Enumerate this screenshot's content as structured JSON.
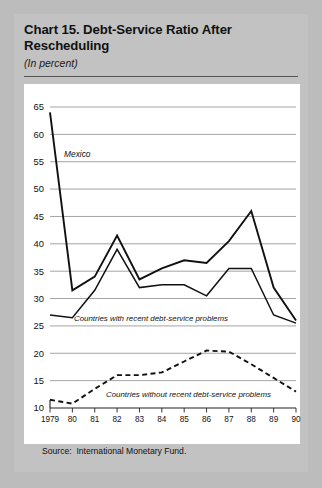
{
  "card": {
    "title": "Chart 15. Debt-Service Ratio After Rescheduling",
    "subtitle": "(In percent)",
    "source": "Source:  International Monetary Fund."
  },
  "chart_data": {
    "type": "line",
    "title": "Chart 15. Debt-Service Ratio After Rescheduling",
    "subtitle": "(In percent)",
    "xlabel": "",
    "ylabel": "",
    "ylim": [
      10,
      65
    ],
    "yticks": [
      10,
      15,
      20,
      25,
      30,
      35,
      40,
      45,
      50,
      55,
      60,
      65
    ],
    "ytick_labels": [
      "10",
      "15",
      "20",
      "25",
      "30",
      "35",
      "40",
      "45",
      "50",
      "55",
      "60",
      "65"
    ],
    "x": [
      1979,
      1980,
      1981,
      1982,
      1983,
      1984,
      1985,
      1986,
      1987,
      1988,
      1989,
      1990
    ],
    "xtick_labels": [
      "1979",
      "80",
      "81",
      "82",
      "83",
      "84",
      "85",
      "86",
      "87",
      "88",
      "89",
      "90"
    ],
    "grid": "horizontal",
    "legend": "inline-annotations",
    "series": [
      {
        "name": "Mexico",
        "style": "solid",
        "label": "Mexico",
        "values": [
          64.0,
          31.5,
          34.0,
          41.5,
          33.5,
          35.5,
          37.0,
          36.5,
          40.5,
          46.0,
          32.0,
          26.0
        ]
      },
      {
        "name": "Countries with recent debt-service problems",
        "style": "solid",
        "label": "Countries with recent debt-service problems",
        "values": [
          27.0,
          26.5,
          31.5,
          39.0,
          32.0,
          32.5,
          32.5,
          30.5,
          35.5,
          35.5,
          27.0,
          25.5
        ]
      },
      {
        "name": "Countries without recent debt-service problems",
        "style": "dashed",
        "label": "Countries without recent debt-service problems",
        "values": [
          11.5,
          10.8,
          13.5,
          16.0,
          16.0,
          16.5,
          18.5,
          20.5,
          20.3,
          18.0,
          15.5,
          13.0
        ]
      }
    ]
  }
}
